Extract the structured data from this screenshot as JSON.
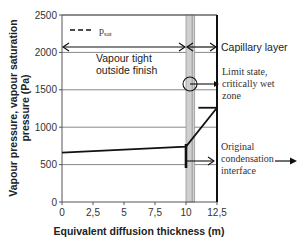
{
  "chart_data": {
    "type": "line",
    "title": "",
    "xlabel": "Equivalent diffusion thickness (m)",
    "ylabel": "Vapour pressure, vapour saturation pressure (Pa)",
    "ylabel_lines": [
      "Vapour pressure, vapour saturation",
      "pressure (Pa)"
    ],
    "xlim": [
      0,
      12.5
    ],
    "ylim": [
      0,
      2500
    ],
    "x_ticks": [
      0,
      2.5,
      5,
      7.5,
      10,
      12.5
    ],
    "x_tick_labels": [
      "0",
      "2,5",
      "5",
      "7,5",
      "10",
      "12,5"
    ],
    "y_ticks": [
      0,
      500,
      1000,
      1500,
      2000,
      2500
    ],
    "y_tick_labels": [
      "0",
      "500",
      "1000",
      "1500",
      "2000",
      "2500"
    ],
    "grid": "horizontal",
    "legend": {
      "position": "upper-left",
      "entries": [
        {
          "label": "p",
          "subscript": "sat",
          "style": "dashed"
        }
      ]
    },
    "series": [
      {
        "name": "Vapour pressure",
        "x": [
          0,
          10,
          12.5
        ],
        "y": [
          660,
          740,
          1260
        ]
      },
      {
        "name": "Vapour pressure at outer surface (horizontal segment)",
        "x": [
          11.0,
          12.5
        ],
        "y": [
          1260,
          1260
        ]
      }
    ],
    "regions": [
      {
        "name": "Capillary layer band",
        "x": [
          10,
          10.7
        ],
        "color": "#cfcfcf"
      }
    ],
    "annotations": [
      {
        "text": "Vapour tight outside finish",
        "x_range": [
          0,
          10
        ],
        "arrow_y": 2110
      },
      {
        "text": "Capillary layer",
        "x_range": [
          10,
          12.5
        ],
        "arrow_y": 2110
      },
      {
        "text": "Limit state, critically wet zone",
        "circle_at": [
          10.3,
          1580
        ]
      },
      {
        "text": "Original condensation interface",
        "marker_at": [
          10,
          520
        ]
      }
    ]
  },
  "labels": {
    "legend_p": "p",
    "legend_sub": "sat",
    "vapour_tight_1": "Vapour tight",
    "vapour_tight_2": "outside finish",
    "capillary_layer": "Capillary layer",
    "limit_1": "Limit state,",
    "limit_2": "critically wet",
    "limit_3": "zone",
    "orig_1": "Original",
    "orig_2": "condensation",
    "orig_3": "interface"
  },
  "colors": {
    "line": "#111111",
    "grid": "#888888",
    "band": "#d0d0d0",
    "band_edge": "#999999"
  }
}
